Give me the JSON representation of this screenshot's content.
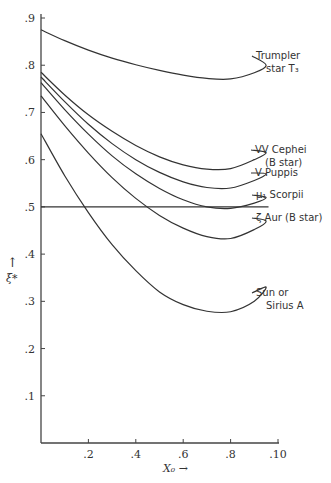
{
  "chart_data": {
    "type": "line",
    "title": "",
    "xlabel": "X₀ →",
    "ylabel": "ξ* ↑",
    "xlim": [
      0,
      0.1
    ],
    "ylim": [
      0,
      0.9
    ],
    "grid": false,
    "x_ticks": [
      ".2",
      ".4",
      ".6",
      ".8",
      ".10"
    ],
    "x_tick_values": [
      0.02,
      0.04,
      0.06,
      0.08,
      0.1
    ],
    "y_ticks": [
      ".1",
      ".2",
      ".3",
      ".4",
      ".5",
      ".6",
      ".7",
      ".8",
      ".9"
    ],
    "y_tick_values": [
      0.1,
      0.2,
      0.3,
      0.4,
      0.5,
      0.6,
      0.7,
      0.8,
      0.9
    ],
    "x": [
      0.0,
      0.01,
      0.02,
      0.03,
      0.04,
      0.05,
      0.06,
      0.07,
      0.08,
      0.09,
      0.095
    ],
    "series": [
      {
        "name": "Trumpler star T3",
        "label_lines": [
          "Trumpler",
          "star T₃"
        ],
        "values": [
          0.875,
          0.852,
          0.832,
          0.815,
          0.801,
          0.789,
          0.779,
          0.772,
          0.771,
          0.784,
          0.8
        ]
      },
      {
        "name": "VV Cephei (B star)",
        "label_lines": [
          "VV Cephei",
          "(B star)"
        ],
        "values": [
          0.785,
          0.737,
          0.695,
          0.66,
          0.63,
          0.606,
          0.589,
          0.58,
          0.581,
          0.6,
          0.615
        ]
      },
      {
        "name": "V Puppis",
        "label_lines": [
          "V Puppis"
        ],
        "values": [
          0.775,
          0.723,
          0.675,
          0.634,
          0.6,
          0.573,
          0.553,
          0.541,
          0.54,
          0.556,
          0.57
        ]
      },
      {
        "name": "μ1 Scorpii",
        "label_lines": [
          "μ₁ Scorpii"
        ],
        "values": [
          0.763,
          0.706,
          0.654,
          0.608,
          0.57,
          0.539,
          0.515,
          0.5,
          0.497,
          0.508,
          0.52
        ]
      },
      {
        "name": "ζ Aur (B star)",
        "label_lines": [
          "ζ Aur (B star)"
        ],
        "values": [
          0.735,
          0.672,
          0.614,
          0.562,
          0.518,
          0.482,
          0.455,
          0.437,
          0.433,
          0.452,
          0.47
        ]
      },
      {
        "name": "Sun or Sirius A",
        "label_lines": [
          "Sun or",
          "Sirius A"
        ],
        "values": [
          0.655,
          0.566,
          0.488,
          0.42,
          0.365,
          0.32,
          0.293,
          0.279,
          0.278,
          0.3,
          0.33
        ]
      },
      {
        "name": "ξ* = 0.5 reference",
        "label_lines": [],
        "values": [
          0.5,
          0.5,
          0.5,
          0.5,
          0.5,
          0.5,
          0.5,
          0.5,
          0.5,
          0.5,
          0.5
        ]
      }
    ]
  },
  "axes": {
    "x_label": "X₀ →",
    "y_label_arrow": "↑",
    "y_label": "ξ*"
  }
}
